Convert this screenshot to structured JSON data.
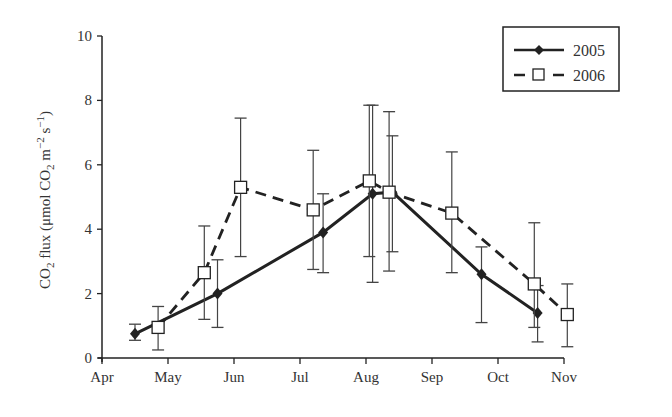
{
  "chart_data": {
    "type": "line",
    "title": "",
    "xlabel": "",
    "ylabel": "CO2 flux (μmol CO2 m−2 s−1)",
    "ylabel_parts": {
      "a": "CO",
      "sub1": "2",
      "b": " flux (μmol CO",
      "sub2": "2",
      "c": " m",
      "sup1": "−2",
      "d": " s",
      "sup2": "−1",
      "e": ")"
    },
    "x_ticks": [
      "Apr",
      "May",
      "Jun",
      "Jul",
      "Aug",
      "Sep",
      "Oct",
      "Nov"
    ],
    "y_ticks": [
      "0",
      "2",
      "4",
      "6",
      "8",
      "10"
    ],
    "ylim": [
      0,
      10
    ],
    "grid": false,
    "legend_position": "upper right",
    "series": [
      {
        "name": "2005",
        "style": "solid, filled diamond markers",
        "x_month": [
          0.5,
          1.75,
          3.35,
          4.1,
          4.4,
          5.75,
          6.6
        ],
        "y": [
          0.75,
          2.0,
          3.9,
          5.1,
          5.15,
          2.6,
          1.4
        ],
        "err_low": [
          0.55,
          0.95,
          2.65,
          2.35,
          3.3,
          1.1,
          0.5
        ],
        "err_high": [
          1.05,
          3.05,
          5.1,
          7.85,
          6.9,
          3.45,
          2.25
        ]
      },
      {
        "name": "2006",
        "style": "dashed, open square markers",
        "x_month": [
          0.85,
          1.55,
          2.1,
          3.2,
          4.05,
          4.35,
          5.3,
          6.55,
          7.05
        ],
        "y": [
          0.95,
          2.65,
          5.3,
          4.6,
          5.5,
          5.15,
          4.5,
          2.3,
          1.35
        ],
        "err_low": [
          0.25,
          1.2,
          3.15,
          2.75,
          3.15,
          2.7,
          2.65,
          0.95,
          0.35
        ],
        "err_high": [
          1.6,
          4.1,
          7.45,
          6.45,
          7.85,
          7.65,
          6.4,
          4.2,
          2.3
        ]
      }
    ]
  },
  "legend": {
    "items": [
      {
        "label": "2005"
      },
      {
        "label": "2006"
      }
    ]
  }
}
